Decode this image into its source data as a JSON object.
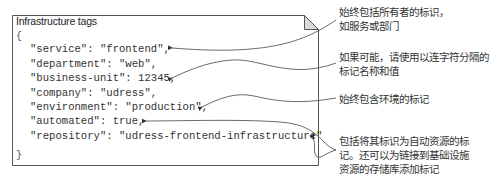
{
  "box": {
    "title": "Infrastructure tags",
    "open_brace": "{",
    "close_brace": "}",
    "lines": [
      "\"service\": \"frontend\",",
      "\"department\": \"web\",",
      "\"business-unit\": 12345,",
      "\"company\": \"udress\",",
      "\"environment\": \"production\",",
      "\"automated\": true,",
      "\"repository\": \"udress-frontend-infrastructure\""
    ]
  },
  "annotations": [
    {
      "lines": [
        "始终包括所有者的标识，",
        "如服务或部门"
      ]
    },
    {
      "lines": [
        "如果可能，请使用以连字符分隔的",
        "标记名称和值"
      ]
    },
    {
      "lines": [
        "始终包含环境的标记"
      ]
    },
    {
      "lines": [
        "包括将其标识为自动资源的标",
        "记。还可以为链接到基础设施",
        "资源的存储库添加标记"
      ]
    }
  ],
  "colors": {
    "border": "#555555",
    "fold_fill": "#d9d9d9",
    "text": "#333333",
    "arrow": "#444444"
  }
}
